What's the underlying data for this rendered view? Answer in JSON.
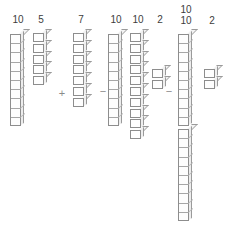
{
  "diagram": {
    "background_color": "#ffffff",
    "line_color": "#8d8d8d",
    "text_color": "#3d3d3d",
    "operator_color": "#8a8a8a",
    "expression": "10 5 + 7 - 10 10 2 - 10 10 2",
    "operators": [
      {
        "symbol": "+",
        "x": 56,
        "y": 88
      },
      {
        "symbol": "−",
        "x": 97,
        "y": 86
      },
      {
        "symbol": "−",
        "x": 163,
        "y": 86
      }
    ],
    "groups": [
      {
        "name": "group-1",
        "columns": [
          {
            "name": "rod-ten-a",
            "label": "10",
            "value": 10,
            "style": "rod",
            "x": 10,
            "y": 30,
            "label_x": 8,
            "label_y": 14
          },
          {
            "name": "stack-five",
            "label": "5",
            "value": 5,
            "style": "cubes",
            "x": 33,
            "y": 30,
            "label_x": 31,
            "label_y": 14
          }
        ]
      },
      {
        "name": "group-2",
        "columns": [
          {
            "name": "stack-seven",
            "label": "7",
            "value": 7,
            "style": "cubes",
            "x": 73,
            "y": 30,
            "label_x": 71,
            "label_y": 14
          }
        ]
      },
      {
        "name": "group-3",
        "columns": [
          {
            "name": "rod-ten-b",
            "label": "10",
            "value": 10,
            "style": "rod",
            "x": 108,
            "y": 30,
            "label_x": 106,
            "label_y": 14
          },
          {
            "name": "stack-ten",
            "label": "10",
            "value": 10,
            "style": "cubes",
            "x": 130,
            "y": 30,
            "label_x": 128,
            "label_y": 14
          },
          {
            "name": "stack-two-a",
            "label": "2",
            "value": 2,
            "style": "cubes",
            "x": 152,
            "y": 66,
            "label_x": 150,
            "label_y": 14
          }
        ]
      },
      {
        "name": "group-4",
        "columns": [
          {
            "name": "rod-ten-c",
            "label": "10",
            "value": 10,
            "style": "rod",
            "x": 178,
            "y": 30,
            "label_x": 176,
            "label_y": 4
          },
          {
            "name": "rod-ten-d",
            "label": "10",
            "value": 10,
            "style": "rod",
            "x": 178,
            "y": 125,
            "label_x": 176,
            "label_y": 15
          },
          {
            "name": "stack-two-b",
            "label": "2",
            "value": 2,
            "style": "cubes",
            "x": 204,
            "y": 66,
            "label_x": 202,
            "label_y": 15
          }
        ]
      }
    ]
  }
}
